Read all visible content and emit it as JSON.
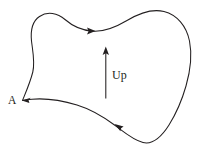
{
  "figure": {
    "type": "closed-curve-orientation-diagram",
    "background_color": "#ffffff",
    "stroke_color": "#231f20",
    "width": 203,
    "height": 153,
    "labels": {
      "vertex_label": "A",
      "direction_label": "Up"
    },
    "icons": {
      "boundary": "closed-curve-icon",
      "up_arrow": "up-arrow-icon",
      "top_orientation_arrow": "orientation-arrowhead-right-icon",
      "bottom_orientation_arrow": "orientation-arrowhead-left-icon"
    },
    "geometry": {
      "vertex_A": [
        22,
        100
      ],
      "up_arrow_from": [
        106,
        98
      ],
      "up_arrow_to": [
        106,
        47
      ],
      "top_arrowhead_at": [
        93,
        30
      ],
      "bottom_arrowhead_at": [
        119,
        127
      ],
      "boundary_path": "M22,100 C26,92 30,80 33,68 C36,55 30,36 38,24 C44,13 57,10 69,18 C80,25 85,29 98,31 C112,33 122,24 135,16 C150,7 168,9 180,22 C192,36 191,60 186,82 C181,104 176,124 164,136 C152,148 140,143 128,135 C112,124 95,111 78,105 C60,98 44,95 22,100 Z"
    }
  }
}
